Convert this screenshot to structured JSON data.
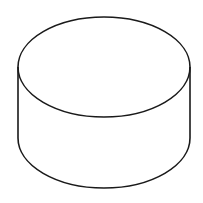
{
  "diagram": {
    "shape": "cylinder",
    "stroke_color": "#1a1a1a",
    "fill_color": "#ffffff",
    "stroke_width": 1.6,
    "top_ellipse": {
      "cx": 104,
      "cy": 67,
      "rx": 86,
      "ry": 50
    },
    "bottom_ellipse": {
      "cx": 104,
      "cy": 138,
      "rx": 86,
      "ry": 50
    }
  }
}
